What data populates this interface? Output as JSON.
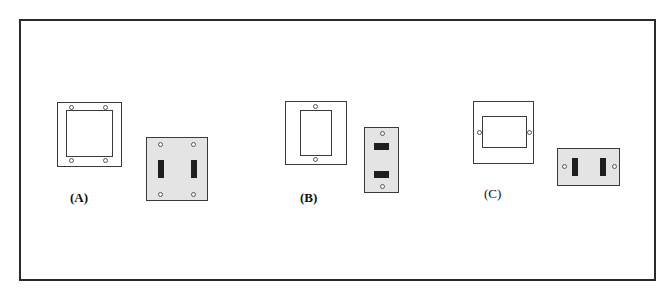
{
  "figure": {
    "panels": [
      {
        "id": "A",
        "label": "(A)",
        "cover_frame": {
          "description": "square trim frame with square opening",
          "screws": 4
        },
        "plate": {
          "description": "double toggle switch plate",
          "toggles": 2,
          "orientation": "vertical",
          "screws": 4
        }
      },
      {
        "id": "B",
        "label": "(B)",
        "cover_frame": {
          "description": "square trim frame with tall rectangular opening",
          "screws": 2
        },
        "plate": {
          "description": "single-gang plate with two horizontal slots",
          "toggles": 2,
          "orientation": "horizontal",
          "screws": 2
        }
      },
      {
        "id": "C",
        "label": "(C)",
        "cover_frame": {
          "description": "square trim frame with wide rectangular opening",
          "screws": 2
        },
        "plate": {
          "description": "horizontal plate with two vertical toggles",
          "toggles": 2,
          "orientation": "vertical",
          "screws": 2
        }
      }
    ],
    "colors": {
      "line": "#3a3a3a",
      "plate_fill": "#e4e4e4",
      "toggle_fill": "#1e1e1e",
      "background": "#ffffff"
    }
  }
}
